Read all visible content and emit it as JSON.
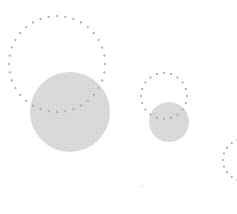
{
  "canvas": {
    "width": 237,
    "height": 214,
    "background": "#ffffff"
  },
  "colors": {
    "solid_fill": "#dcdcdc",
    "solid_texture": "#cfcfcf",
    "dot": "#a9a9a9",
    "speck": "#e2e2e2"
  },
  "shapes": {
    "group_large": {
      "dotted_ring": {
        "cx": 57,
        "cy": 64,
        "r": 48,
        "dot_count": 36
      },
      "solid_circle": {
        "cx": 70,
        "cy": 112,
        "r": 40
      }
    },
    "group_small": {
      "dotted_ring": {
        "cx": 164,
        "cy": 96,
        "r": 23,
        "dot_count": 20
      },
      "solid_circle": {
        "cx": 169,
        "cy": 122,
        "r": 20
      }
    },
    "group_partial": {
      "dotted_ring": {
        "cx": 244,
        "cy": 160,
        "r": 21,
        "dot_count": 20
      }
    },
    "speck": {
      "cx": 142,
      "cy": 186,
      "r": 1
    }
  }
}
